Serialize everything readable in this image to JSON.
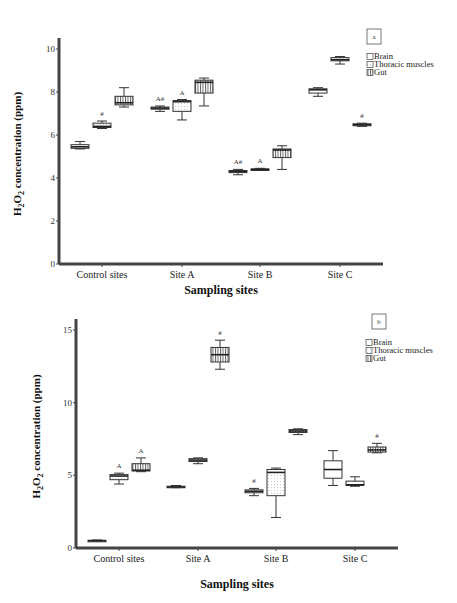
{
  "chart_data": [
    {
      "type": "box",
      "panel_label": "a",
      "xlabel": "Sampling sites",
      "ylabel": "H2O2 concentration (ppm)",
      "ylabel_parts": {
        "pre": "H",
        "sub1": "2",
        "mid": "O",
        "sub2": "2",
        "post": " concentration (ppm)"
      },
      "ylim": [
        0,
        10
      ],
      "yticks": [
        0,
        2,
        4,
        6,
        8,
        10
      ],
      "categories": [
        "Control sites",
        "Site A",
        "Site B",
        "Site C"
      ],
      "legend": [
        "Brain",
        "Thoracic muscles",
        "Gut"
      ],
      "legend_position": "top-right",
      "series": [
        {
          "name": "Brain",
          "boxes": [
            {
              "min": 5.35,
              "q1": 5.38,
              "median": 5.45,
              "q3": 5.55,
              "max": 5.7,
              "annotation": ""
            },
            {
              "min": 7.1,
              "q1": 7.2,
              "median": 7.25,
              "q3": 7.3,
              "max": 7.35,
              "annotation": "A#"
            },
            {
              "min": 4.15,
              "q1": 4.25,
              "median": 4.3,
              "q3": 4.35,
              "max": 4.4,
              "annotation": "A#"
            },
            {
              "min": 7.8,
              "q1": 7.95,
              "median": 8.1,
              "q3": 8.15,
              "max": 8.2,
              "annotation": ""
            }
          ]
        },
        {
          "name": "Thoracic muscles",
          "boxes": [
            {
              "min": 6.3,
              "q1": 6.35,
              "median": 6.4,
              "q3": 6.55,
              "max": 6.65,
              "annotation": "#"
            },
            {
              "min": 6.7,
              "q1": 7.1,
              "median": 7.55,
              "q3": 7.6,
              "max": 7.65,
              "annotation": "A"
            },
            {
              "min": 4.35,
              "q1": 4.38,
              "median": 4.4,
              "q3": 4.42,
              "max": 4.45,
              "annotation": "A"
            },
            {
              "min": 9.3,
              "q1": 9.45,
              "median": 9.5,
              "q3": 9.6,
              "max": 9.65,
              "annotation": ""
            }
          ]
        },
        {
          "name": "Gut",
          "boxes": [
            {
              "min": 7.3,
              "q1": 7.4,
              "median": 7.5,
              "q3": 7.8,
              "max": 8.2,
              "annotation": ""
            },
            {
              "min": 7.35,
              "q1": 7.95,
              "median": 8.45,
              "q3": 8.55,
              "max": 8.65,
              "annotation": ""
            },
            {
              "min": 4.4,
              "q1": 4.95,
              "median": 5.3,
              "q3": 5.35,
              "max": 5.5,
              "annotation": ""
            },
            {
              "min": 6.4,
              "q1": 6.43,
              "median": 6.48,
              "q3": 6.52,
              "max": 6.55,
              "annotation": "#"
            }
          ]
        }
      ]
    },
    {
      "type": "box",
      "panel_label": "b",
      "xlabel": "Sampling sites",
      "ylabel": "H2O2 concentration (ppm)",
      "ylabel_parts": {
        "pre": "H",
        "sub1": "2",
        "mid": "O",
        "sub2": "2",
        "post": " concentration (ppm)"
      },
      "ylim": [
        0,
        15
      ],
      "yticks": [
        0,
        5,
        10,
        15
      ],
      "categories": [
        "Control sites",
        "Site A",
        "Site B",
        "Site C"
      ],
      "legend": [
        "Brain",
        "Thoracic muscles",
        "Gut"
      ],
      "legend_position": "top-right",
      "series": [
        {
          "name": "Brain",
          "boxes": [
            {
              "min": 0.45,
              "q1": 0.48,
              "median": 0.5,
              "q3": 0.53,
              "max": 0.55,
              "annotation": ""
            },
            {
              "min": 4.15,
              "q1": 4.18,
              "median": 4.2,
              "q3": 4.25,
              "max": 4.3,
              "annotation": ""
            },
            {
              "min": 3.6,
              "q1": 3.8,
              "median": 3.9,
              "q3": 4.0,
              "max": 4.1,
              "annotation": "#"
            },
            {
              "min": 4.3,
              "q1": 4.8,
              "median": 5.4,
              "q3": 6.0,
              "max": 6.7,
              "annotation": ""
            }
          ]
        },
        {
          "name": "Thoracic muscles",
          "boxes": [
            {
              "min": 4.4,
              "q1": 4.7,
              "median": 4.95,
              "q3": 5.05,
              "max": 5.15,
              "annotation": "A"
            },
            {
              "min": 5.8,
              "q1": 5.95,
              "median": 6.05,
              "q3": 6.15,
              "max": 6.2,
              "annotation": ""
            },
            {
              "min": 2.1,
              "q1": 3.6,
              "median": 5.2,
              "q3": 5.4,
              "max": 5.5,
              "annotation": ""
            },
            {
              "min": 4.25,
              "q1": 4.3,
              "median": 4.35,
              "q3": 4.6,
              "max": 4.9,
              "annotation": ""
            }
          ]
        },
        {
          "name": "Gut",
          "boxes": [
            {
              "min": 5.25,
              "q1": 5.3,
              "median": 5.35,
              "q3": 5.8,
              "max": 6.2,
              "annotation": "A"
            },
            {
              "min": 12.3,
              "q1": 12.8,
              "median": 13.3,
              "q3": 13.8,
              "max": 14.3,
              "annotation": "#"
            },
            {
              "min": 7.8,
              "q1": 7.95,
              "median": 8.05,
              "q3": 8.15,
              "max": 8.2,
              "annotation": ""
            },
            {
              "min": 6.55,
              "q1": 6.6,
              "median": 6.75,
              "q3": 6.95,
              "max": 7.2,
              "annotation": "#"
            }
          ]
        }
      ]
    }
  ]
}
